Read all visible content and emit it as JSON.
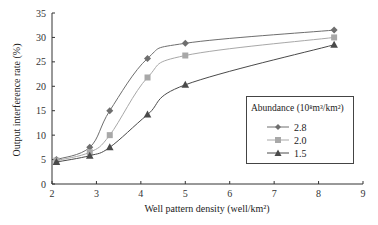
{
  "chart_data": {
    "type": "line",
    "title": "",
    "xlabel": "Well pattern density (well/km²)",
    "ylabel": "Output interference rate (%)",
    "xlim": [
      2,
      9
    ],
    "ylim": [
      0,
      35
    ],
    "x_ticks": [
      2,
      3,
      4,
      5,
      6,
      7,
      8,
      9
    ],
    "y_ticks": [
      0,
      5,
      10,
      15,
      20,
      25,
      30,
      35
    ],
    "grid": false,
    "legend_title": "Abundance (10⁸m³/km²)",
    "legend_position": "right-middle inside",
    "series": [
      {
        "name": "2.8",
        "marker": "diamond",
        "color": "#6e6e6e",
        "x": [
          2.1,
          2.85,
          3.3,
          4.15,
          5.0,
          8.35
        ],
        "values": [
          5.0,
          7.5,
          15.0,
          25.7,
          28.8,
          31.5
        ]
      },
      {
        "name": "2.0",
        "marker": "square",
        "color": "#a8a8a8",
        "x": [
          2.1,
          2.85,
          3.3,
          4.15,
          5.0,
          8.35
        ],
        "values": [
          4.8,
          6.5,
          10.0,
          21.8,
          26.3,
          30.0
        ]
      },
      {
        "name": "1.5",
        "marker": "triangle",
        "color": "#4a4a4a",
        "x": [
          2.1,
          2.85,
          3.3,
          4.15,
          5.0,
          8.35
        ],
        "values": [
          4.5,
          5.8,
          7.5,
          14.2,
          20.3,
          28.5
        ]
      }
    ]
  },
  "legend": {
    "title": "Abundance (10⁸m³/km²)",
    "items": [
      "2.8",
      "2.0",
      "1.5"
    ]
  }
}
